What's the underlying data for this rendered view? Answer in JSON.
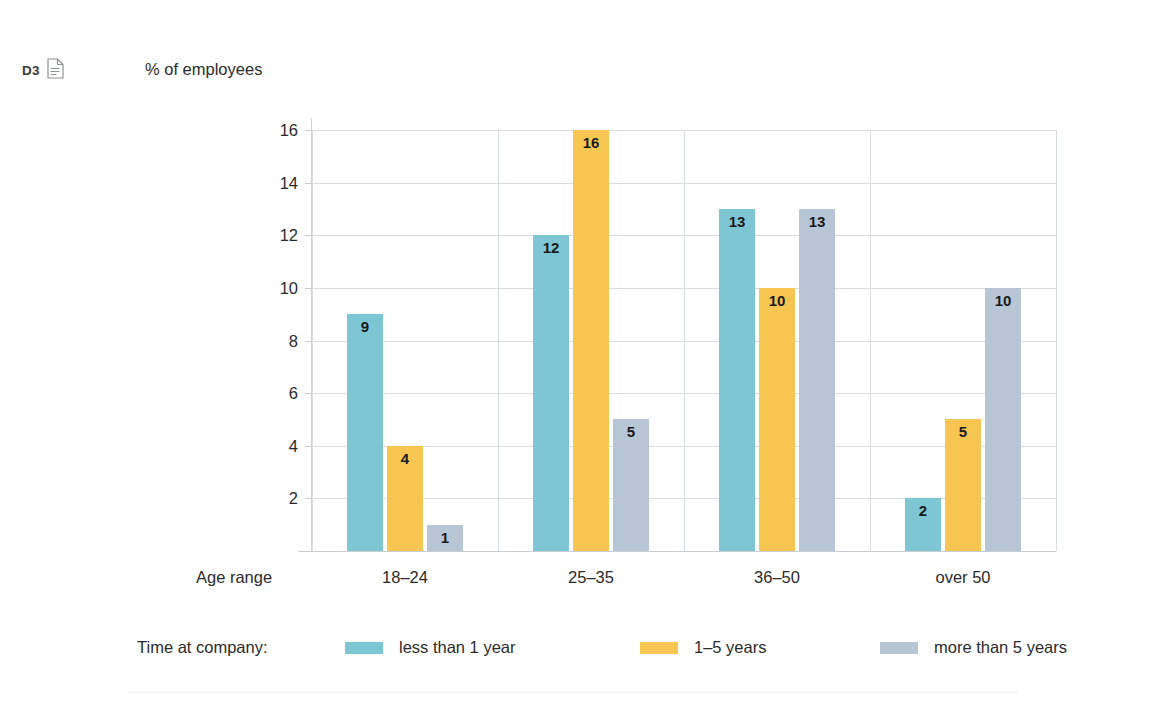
{
  "header": {
    "cutoff_title": "Employee survey: age groups",
    "tag_label": "D3",
    "doc_icon": "document-icon"
  },
  "axis_titles": {
    "y": "% of employees",
    "x": "Age range"
  },
  "legend": {
    "title": "Time at company:",
    "items": [
      {
        "label": "less than 1 year",
        "color": "#7FC6D5"
      },
      {
        "label": "1–5 years",
        "color": "#F7C552"
      },
      {
        "label": "more than 5 years",
        "color": "#B8C5D4"
      }
    ]
  },
  "chart_data": {
    "type": "bar",
    "title": "Employee survey: age groups",
    "xlabel": "Age range",
    "ylabel": "% of employees",
    "ylim": [
      0,
      16
    ],
    "yticks": [
      2,
      4,
      6,
      8,
      10,
      12,
      14,
      16
    ],
    "grid": true,
    "legend_position": "bottom",
    "value_labels": true,
    "categories": [
      "18–24",
      "25–35",
      "36–50",
      "over 50"
    ],
    "series": [
      {
        "name": "less than 1 year",
        "color": "#7FC6D5",
        "values": [
          9,
          12,
          13,
          2
        ]
      },
      {
        "name": "1–5 years",
        "color": "#F7C552",
        "values": [
          4,
          16,
          10,
          5
        ]
      },
      {
        "name": "more than 5 years",
        "color": "#B8C5D4",
        "values": [
          1,
          5,
          13,
          10
        ]
      }
    ]
  }
}
